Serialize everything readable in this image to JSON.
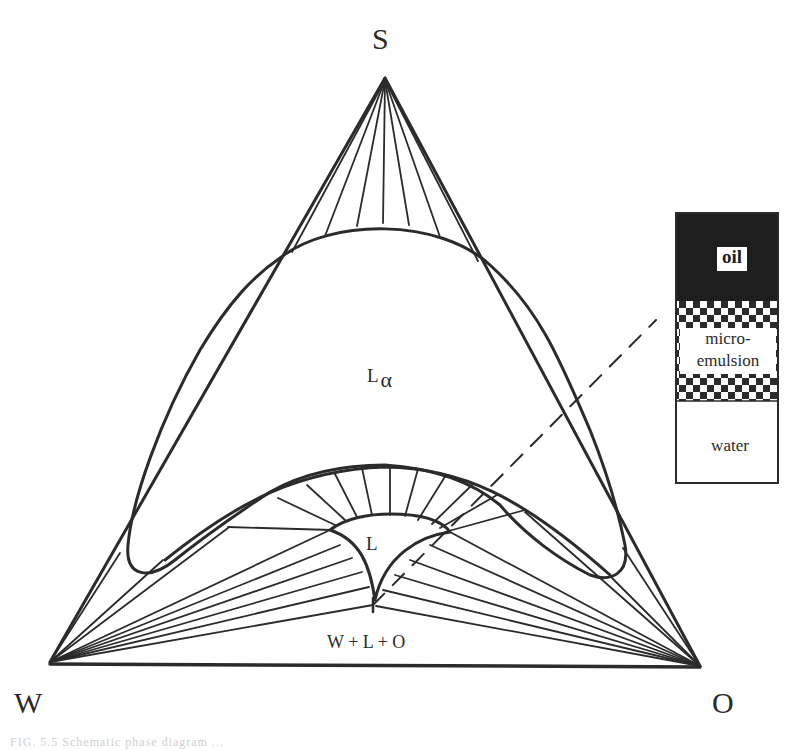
{
  "diagram": {
    "type": "ternary phase diagram",
    "vertices": {
      "top": {
        "label": "S"
      },
      "bottom_left": {
        "label": "W"
      },
      "bottom_right": {
        "label": "O"
      }
    },
    "regions": {
      "lamellar": {
        "label": "L",
        "subscript": "α"
      },
      "microemulsion": {
        "label": "L"
      },
      "three_phase": {
        "label": "W + L + O"
      }
    },
    "sample_tube": {
      "layers": [
        {
          "name": "oil",
          "label": "oil",
          "fill": "#1e1e1e"
        },
        {
          "name": "microemulsion",
          "label_line1": "micro-",
          "label_line2": "emulsion",
          "fill": "checkerboard"
        },
        {
          "name": "water",
          "label": "water",
          "fill": "#ffffff"
        }
      ]
    },
    "caption": "FIG. 5.5  Schematic phase diagram ..."
  },
  "colors": {
    "line": "#2b2b2b",
    "background": "#ffffff"
  }
}
